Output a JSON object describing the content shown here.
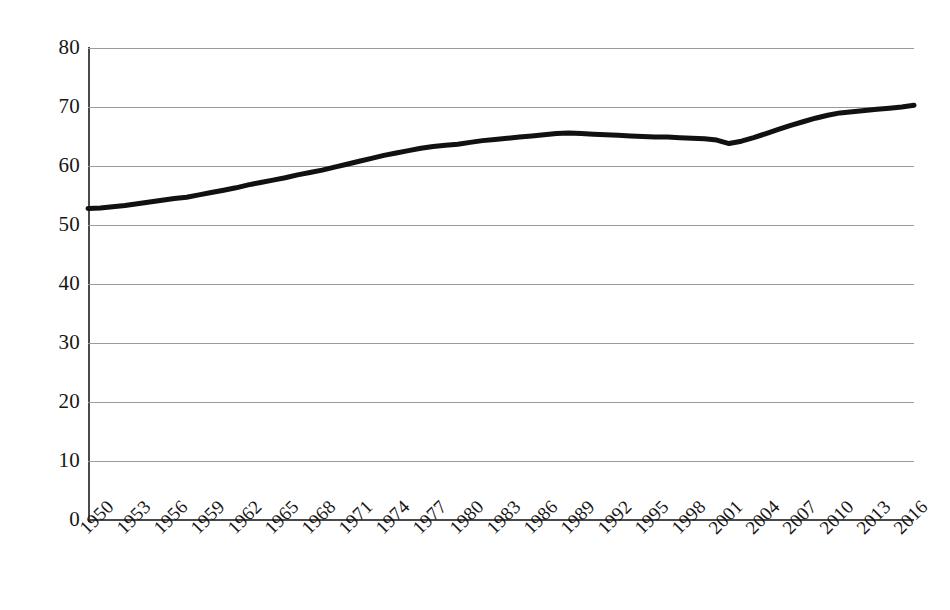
{
  "chart_data": {
    "type": "line",
    "title": "",
    "subtitle": "",
    "xlabel": "",
    "ylabel": "",
    "xlim": [
      1950,
      2017
    ],
    "ylim": [
      0,
      80
    ],
    "grid": true,
    "legend": false,
    "legend_position": "none",
    "y_ticks": [
      80,
      70,
      60,
      50,
      40,
      30,
      20,
      10,
      0
    ],
    "y_tick_labels": [
      "80",
      "70",
      "60",
      "50",
      "40",
      "30",
      "20",
      "10",
      "0"
    ],
    "x_tick_labels": [
      "1950",
      "1953",
      "1956",
      "1959",
      "1962",
      "1965",
      "1968",
      "1971",
      "1974",
      "1977",
      "1980",
      "1983",
      "1986",
      "1989",
      "1992",
      "1995",
      "1998",
      "2001",
      "2004",
      "2007",
      "2010",
      "2013",
      "2016"
    ],
    "series": [
      {
        "name": "value",
        "color": "#111111",
        "line_width": 5,
        "x": [
          1950,
          1951,
          1952,
          1953,
          1954,
          1955,
          1956,
          1957,
          1958,
          1959,
          1960,
          1961,
          1962,
          1963,
          1964,
          1965,
          1966,
          1967,
          1968,
          1969,
          1970,
          1971,
          1972,
          1973,
          1974,
          1975,
          1976,
          1977,
          1978,
          1979,
          1980,
          1981,
          1982,
          1983,
          1984,
          1985,
          1986,
          1987,
          1988,
          1989,
          1990,
          1991,
          1992,
          1993,
          1994,
          1995,
          1996,
          1997,
          1998,
          1999,
          2000,
          2001,
          2002,
          2003,
          2004,
          2005,
          2006,
          2007,
          2008,
          2009,
          2010,
          2011,
          2012,
          2013,
          2014,
          2015,
          2016,
          2017
        ],
        "values": [
          52.8,
          52.9,
          53.1,
          53.3,
          53.6,
          53.9,
          54.2,
          54.5,
          54.7,
          55.1,
          55.5,
          55.9,
          56.3,
          56.8,
          57.2,
          57.6,
          58.0,
          58.5,
          58.9,
          59.3,
          59.8,
          60.3,
          60.8,
          61.3,
          61.8,
          62.2,
          62.6,
          63.0,
          63.3,
          63.5,
          63.7,
          64.0,
          64.3,
          64.5,
          64.7,
          64.9,
          65.1,
          65.3,
          65.5,
          65.6,
          65.5,
          65.4,
          65.3,
          65.2,
          65.1,
          65.0,
          64.9,
          64.9,
          64.8,
          64.7,
          64.6,
          64.4,
          63.8,
          64.2,
          64.8,
          65.5,
          66.2,
          66.9,
          67.5,
          68.1,
          68.6,
          69.0,
          69.2,
          69.4,
          69.6,
          69.8,
          70.0,
          70.3
        ]
      }
    ]
  },
  "axes": {
    "y_axis_name": "y-axis",
    "x_axis_name": "x-axis"
  }
}
